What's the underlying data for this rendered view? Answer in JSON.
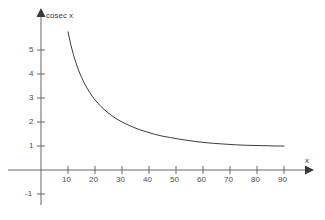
{
  "chart_data": {
    "type": "line",
    "title": "",
    "subtitle": "",
    "xlabel": "x",
    "ylabel": "cosec x",
    "legend": [],
    "grid": false,
    "xlim": [
      0,
      100
    ],
    "ylim": [
      -1.6,
      5.9
    ],
    "xticks": [
      10,
      20,
      30,
      40,
      50,
      60,
      70,
      80,
      90
    ],
    "xtick_labels": [
      "10",
      "20",
      "30",
      "40",
      "50",
      "60",
      "70",
      "80",
      "90"
    ],
    "yticks": [
      5,
      4,
      3,
      2,
      1,
      -1
    ],
    "ytick_labels": [
      "5",
      "4",
      "3",
      "2",
      "1",
      "-1"
    ],
    "axis_arrows": true,
    "series": [
      {
        "name": "cosec x",
        "color": "#3c3c3c",
        "x": [
          10,
          11,
          12,
          13,
          14,
          15,
          16,
          17,
          18,
          19,
          20,
          22,
          24,
          26,
          28,
          30,
          33,
          36,
          39,
          42,
          45,
          48,
          51,
          54,
          57,
          60,
          64,
          68,
          72,
          76,
          80,
          84,
          87,
          90
        ],
        "y": [
          5.76,
          5.24,
          4.81,
          4.45,
          4.13,
          3.86,
          3.63,
          3.42,
          3.24,
          3.07,
          2.92,
          2.67,
          2.46,
          2.28,
          2.13,
          2.0,
          1.84,
          1.7,
          1.59,
          1.49,
          1.41,
          1.35,
          1.29,
          1.24,
          1.19,
          1.15,
          1.11,
          1.08,
          1.05,
          1.03,
          1.02,
          1.01,
          1.0,
          1.0
        ]
      }
    ]
  },
  "axes": {
    "x_axis_label": "x",
    "y_axis_label": "cosec x"
  },
  "colors": {
    "curve": "#3c3c3c",
    "axis": "#666666",
    "text": "#4a4a4a",
    "background": "#ffffff"
  }
}
